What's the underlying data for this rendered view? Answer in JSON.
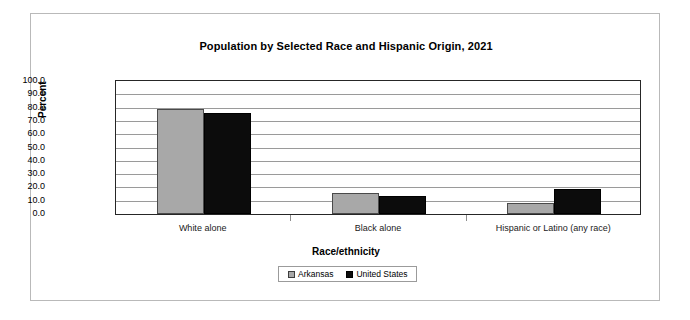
{
  "chart_data": {
    "type": "bar",
    "title": "Population by Selected Race and Hispanic Origin, 2021",
    "xlabel": "Race/ethnicity",
    "ylabel": "Percent",
    "categories": [
      "White alone",
      "Black alone",
      "Hispanic or Latino (any race)"
    ],
    "series": [
      {
        "name": "Arkansas",
        "color": "#a8a8a8",
        "values": [
          79.0,
          15.7,
          8.5
        ]
      },
      {
        "name": "United States",
        "color": "#0c0c0c",
        "values": [
          75.8,
          13.6,
          18.9
        ]
      }
    ],
    "ylim": [
      0.0,
      100.0
    ],
    "ytick_interval": 10.0,
    "ytick_labels": [
      "100.0",
      "90.0",
      "80.0",
      "70.0",
      "60.0",
      "50.0",
      "40.0",
      "30.0",
      "20.0",
      "10.0",
      "0.0"
    ],
    "grid": true,
    "legend_position": "bottom"
  }
}
